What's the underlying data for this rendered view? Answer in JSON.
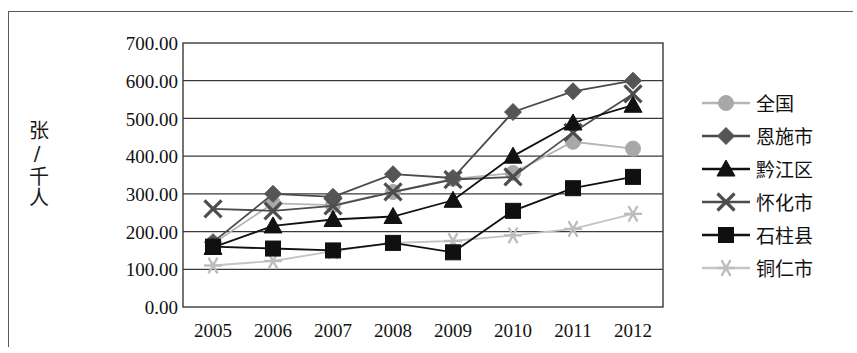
{
  "chart_data": {
    "type": "line",
    "title": "",
    "subtitle": "",
    "xlabel": "",
    "ylabel": "张/千人",
    "x": [
      "2005",
      "2006",
      "2007",
      "2008",
      "2009",
      "2010",
      "2011",
      "2012"
    ],
    "categories": [
      "2005",
      "2006",
      "2007",
      "2008",
      "2009",
      "2010",
      "2011",
      "2012"
    ],
    "ylim": [
      0,
      700
    ],
    "ytick_step": 100,
    "yticks": [
      "700.00",
      "600.00",
      "500.00",
      "400.00",
      "300.00",
      "200.00",
      "100.00",
      "0.00"
    ],
    "ytick_values": [
      700,
      600,
      500,
      400,
      300,
      200,
      100,
      0
    ],
    "grid": true,
    "grid_axis": "y",
    "legend_position": "right",
    "series": [
      {
        "name": "全国",
        "marker": "circle",
        "color": "#a8a8a8",
        "line_color": "#b5b5b5",
        "values": [
          168,
          275,
          270,
          305,
          340,
          355,
          438,
          420
        ]
      },
      {
        "name": "恩施市",
        "marker": "diamond",
        "color": "#555555",
        "line_color": "#4a4a4a",
        "values": [
          172,
          300,
          292,
          352,
          342,
          517,
          572,
          600
        ]
      },
      {
        "name": "黔江区",
        "marker": "triangle",
        "color": "#111111",
        "line_color": "#111111",
        "values": [
          158,
          215,
          232,
          240,
          283,
          400,
          488,
          535
        ]
      },
      {
        "name": "怀化市",
        "marker": "x",
        "color": "#4d4d4d",
        "line_color": "#4d4d4d",
        "values": [
          260,
          255,
          268,
          305,
          338,
          345,
          463,
          565
        ]
      },
      {
        "name": "石柱县",
        "marker": "square",
        "color": "#101010",
        "line_color": "#101010",
        "values": [
          160,
          155,
          150,
          170,
          145,
          255,
          315,
          345
        ]
      },
      {
        "name": "铜仁市",
        "marker": "asterisk",
        "color": "#bdbdbd",
        "line_color": "#c4c4c4",
        "values": [
          110,
          122,
          148,
          170,
          175,
          190,
          207,
          247
        ]
      }
    ]
  },
  "legend": {
    "items": [
      {
        "label": "全国"
      },
      {
        "label": "恩施市"
      },
      {
        "label": "黔江区"
      },
      {
        "label": "怀化市"
      },
      {
        "label": "石柱县"
      },
      {
        "label": "铜仁市"
      }
    ]
  },
  "axes": {
    "y_title": "张/千人",
    "y_labels": [
      "700.00",
      "600.00",
      "500.00",
      "400.00",
      "300.00",
      "200.00",
      "100.00",
      "0.00"
    ],
    "x_labels": [
      "2005",
      "2006",
      "2007",
      "2008",
      "2009",
      "2010",
      "2011",
      "2012"
    ]
  },
  "colors": {
    "plot_border": "#3a3a3a",
    "gridline": "#3a3a3a",
    "background": "#ffffff",
    "text": "#111111"
  }
}
